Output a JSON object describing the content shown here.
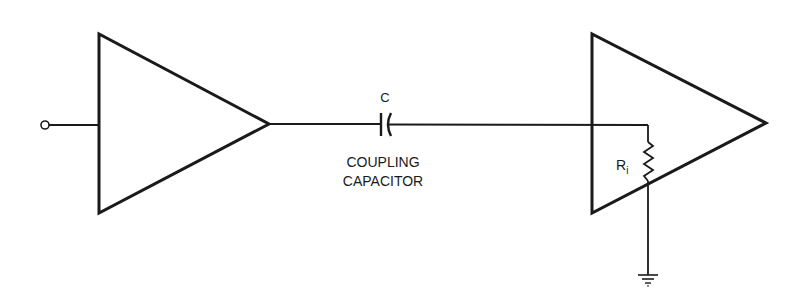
{
  "diagram": {
    "type": "circuit-schematic",
    "stroke_color": "#1a1a1a",
    "background": "#ffffff",
    "components": {
      "input_terminal": {
        "label": ""
      },
      "amplifier_1": {
        "label": ""
      },
      "coupling_capacitor": {
        "symbol_label": "C",
        "caption_line1": "COUPLING",
        "caption_line2": "CAPACITOR"
      },
      "amplifier_2": {
        "label": ""
      },
      "input_resistor": {
        "label_main": "R",
        "label_sub": "i"
      },
      "ground": {
        "label": ""
      }
    }
  }
}
